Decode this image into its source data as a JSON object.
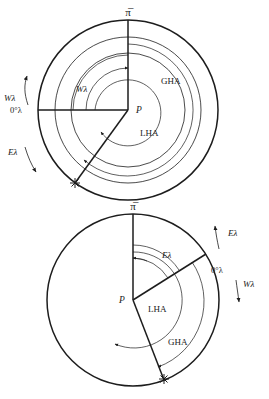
{
  "figure": {
    "ink_color": "#1d1d1d",
    "background_color": "#ffffff",
    "width": 269,
    "height": 399
  },
  "symbols": {
    "aries": "π̅",
    "aries_name": "first-point-of-aries",
    "star": "✻",
    "star_name": "celestial-body-star",
    "lambda": "λ",
    "degree": "°"
  },
  "upper": {
    "name": "west-longitude-diagram",
    "aries_label": "π̅",
    "pole_label": "P",
    "gha_label": "GHA",
    "lha_label": "LHA",
    "zero_meridian_label": "0°λ",
    "inner_longitude_label": "Wλ",
    "west_side_label": "Wλ",
    "east_side_label": "Eλ",
    "star_label": "✻",
    "rings": 3,
    "center_x": 128,
    "center_y": 110,
    "radii": [
      90,
      73,
      57
    ],
    "aries_bearing_deg": 0,
    "observer_meridian_bearing_deg": 270,
    "star_bearing_deg": 216,
    "west_arrow_direction": "up",
    "east_arrow_direction": "down"
  },
  "lower": {
    "name": "east-longitude-diagram",
    "aries_label": "π̅",
    "pole_label": "P",
    "gha_label": "GHA",
    "lha_label": "LHA",
    "zero_meridian_label": "0°λ",
    "inner_longitude_label": "Eλ",
    "east_side_label": "Eλ",
    "west_side_label": "Wλ",
    "star_label": "✻",
    "rings": 1,
    "center_x": 133,
    "center_y": 300,
    "radii": [
      86
    ],
    "aries_bearing_deg": 0,
    "observer_meridian_bearing_deg": 58,
    "star_bearing_deg": 159,
    "east_arrow_direction": "up",
    "west_arrow_direction": "down"
  }
}
